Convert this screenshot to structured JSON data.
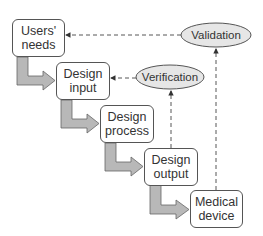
{
  "diagram": {
    "stages": [
      {
        "id": "users-needs",
        "line1": "Users'",
        "line2": "needs"
      },
      {
        "id": "design-input",
        "line1": "Design",
        "line2": "input"
      },
      {
        "id": "design-process",
        "line1": "Design",
        "line2": "process"
      },
      {
        "id": "design-output",
        "line1": "Design",
        "line2": "output"
      },
      {
        "id": "medical-device",
        "line1": "Medical",
        "line2": "device"
      }
    ],
    "checks": [
      {
        "id": "validation",
        "label": "Validation",
        "from": "medical-device",
        "to": "users-needs"
      },
      {
        "id": "verification",
        "label": "Verification",
        "from": "design-output",
        "to": "design-input"
      }
    ],
    "colors": {
      "box_border": "#555555",
      "ellipse_fill": "#e6e6e6",
      "arrow_fill": "#b8b8b8",
      "arrow_stroke": "#666666",
      "dashed_line": "#444444"
    }
  }
}
